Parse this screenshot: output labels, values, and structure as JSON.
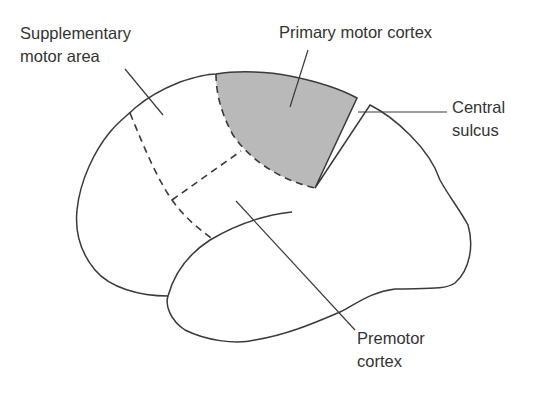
{
  "diagram": {
    "type": "brain-lateral-view",
    "colors": {
      "outline": "#3a3a3a",
      "shaded_region": "#b9b9b9",
      "text": "#333333",
      "background": "#ffffff"
    },
    "labels": {
      "supplementary_motor_area": "Supplementary\nmotor area",
      "primary_motor_cortex": "Primary motor cortex",
      "central_sulcus": "Central\nsulcus",
      "premotor_cortex": "Premotor\ncortex"
    },
    "regions": [
      {
        "name": "Primary motor cortex",
        "shaded": true
      },
      {
        "name": "Supplementary motor area",
        "shaded": false,
        "border": "dashed"
      },
      {
        "name": "Premotor cortex",
        "shaded": false,
        "border": "dashed"
      }
    ]
  }
}
